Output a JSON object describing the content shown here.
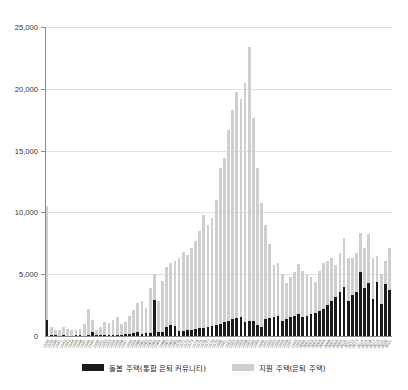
{
  "chart_data": {
    "type": "bar",
    "title": "",
    "subtitle": "",
    "xlabel": "",
    "ylabel": "",
    "stacked": true,
    "grid": true,
    "legend_position": "bottom",
    "ylim": [
      0,
      25000
    ],
    "yticks": [
      0,
      5000,
      10000,
      15000,
      20000,
      25000
    ],
    "ytick_labels": [
      "0",
      "5,000",
      "10,000",
      "15,000",
      "20,000",
      "25,000"
    ],
    "categories": [
      "1938",
      "1939",
      "1940",
      "1941",
      "1942",
      "1943",
      "1944",
      "1945",
      "1946",
      "1947",
      "1948",
      "1949",
      "1950",
      "1951",
      "1952",
      "1953",
      "1954",
      "1955",
      "1956",
      "1957",
      "1958",
      "1959",
      "1960",
      "1961",
      "1962",
      "1963",
      "1964",
      "1965",
      "1966",
      "1967",
      "1968",
      "1969",
      "1970",
      "1971",
      "1972",
      "1973",
      "1974",
      "1975",
      "1976",
      "1977",
      "1978",
      "1979",
      "1980",
      "1981",
      "1982",
      "1983",
      "1984",
      "1985",
      "1986",
      "1987",
      "1988",
      "1989",
      "1990",
      "1991",
      "1992",
      "1993",
      "1994",
      "1995",
      "1996",
      "1997",
      "1998",
      "1999",
      "2000",
      "2001",
      "2002",
      "2003",
      "2004",
      "2005",
      "2006",
      "2007",
      "2008",
      "2009",
      "2010",
      "2011",
      "2012",
      "2013",
      "2014",
      "2015",
      "2016",
      "2017",
      "2018",
      "2019",
      "2020",
      "2021"
    ],
    "series": [
      {
        "name": "돌봄 주택(통합 은퇴 커뮤니티)",
        "color": "#1b1b1b",
        "values": [
          1300,
          120,
          60,
          40,
          60,
          30,
          40,
          50,
          60,
          40,
          70,
          300,
          60,
          60,
          70,
          70,
          90,
          100,
          110,
          130,
          150,
          280,
          350,
          200,
          240,
          260,
          2900,
          300,
          330,
          700,
          900,
          800,
          400,
          430,
          470,
          520,
          560,
          620,
          680,
          760,
          840,
          900,
          1000,
          1100,
          1250,
          1400,
          1450,
          1500,
          1150,
          1200,
          1250,
          900,
          700,
          1350,
          1450,
          1550,
          1600,
          1250,
          1400,
          1500,
          1650,
          1800,
          1500,
          1600,
          1750,
          1900,
          2050,
          2200,
          2500,
          2800,
          3150,
          3600,
          4000,
          2800,
          3300,
          3600,
          5200,
          3900,
          4250,
          3000,
          4400,
          2600,
          4200,
          3700
        ]
      },
      {
        "name": "지원 주택(은퇴 주택)",
        "color": "#cfcfcf",
        "values": [
          9200,
          600,
          420,
          480,
          700,
          500,
          460,
          420,
          480,
          900,
          2100,
          1000,
          450,
          700,
          1100,
          1000,
          1200,
          1400,
          900,
          1000,
          1500,
          1800,
          2300,
          2600,
          2000,
          3600,
          2100,
          2500,
          4100,
          4900,
          5000,
          5300,
          5900,
          6400,
          6100,
          6600,
          7100,
          7900,
          9100,
          8200,
          8700,
          10100,
          12600,
          13300,
          15400,
          16900,
          18300,
          17700,
          19300,
          22200,
          16400,
          12700,
          10100,
          7600,
          6000,
          4200,
          4300,
          3800,
          2900,
          3300,
          3500,
          4000,
          3800,
          3300,
          3000,
          2500,
          3200,
          3700,
          3600,
          3500,
          2600,
          3100,
          3900,
          3500,
          3000,
          3100,
          3100,
          3200,
          4000,
          3300,
          2100,
          2400,
          1900,
          3400
        ]
      }
    ]
  },
  "legend": {
    "items": [
      {
        "label": "돌봄 주택(통합 은퇴 커뮤니티)",
        "color": "#1b1b1b"
      },
      {
        "label": "지원 주택(은퇴 주택)",
        "color": "#cfcfcf"
      }
    ]
  }
}
